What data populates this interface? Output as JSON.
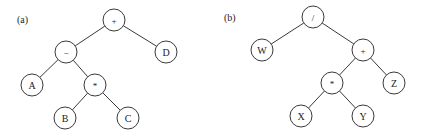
{
  "trees": [
    {
      "label": "(a)",
      "nodes": [
        {
          "id": "a_plus",
          "text": "+",
          "kind": "operator"
        },
        {
          "id": "a_minus",
          "text": "−",
          "kind": "operator"
        },
        {
          "id": "a_D",
          "text": "D",
          "kind": "operand"
        },
        {
          "id": "a_A",
          "text": "A",
          "kind": "operand"
        },
        {
          "id": "a_star",
          "text": "*",
          "kind": "operator"
        },
        {
          "id": "a_B",
          "text": "B",
          "kind": "operand"
        },
        {
          "id": "a_C",
          "text": "C",
          "kind": "operand"
        }
      ],
      "edges": [
        [
          "a_plus",
          "a_minus"
        ],
        [
          "a_plus",
          "a_D"
        ],
        [
          "a_minus",
          "a_A"
        ],
        [
          "a_minus",
          "a_star"
        ],
        [
          "a_star",
          "a_B"
        ],
        [
          "a_star",
          "a_C"
        ]
      ]
    },
    {
      "label": "(b)",
      "nodes": [
        {
          "id": "b_slash",
          "text": "/",
          "kind": "operator"
        },
        {
          "id": "b_W",
          "text": "W",
          "kind": "operand"
        },
        {
          "id": "b_plus",
          "text": "+",
          "kind": "operator"
        },
        {
          "id": "b_star",
          "text": "*",
          "kind": "operator"
        },
        {
          "id": "b_Z",
          "text": "Z",
          "kind": "operand"
        },
        {
          "id": "b_X",
          "text": "X",
          "kind": "operand"
        },
        {
          "id": "b_Y",
          "text": "Y",
          "kind": "operand"
        }
      ],
      "edges": [
        [
          "b_slash",
          "b_W"
        ],
        [
          "b_slash",
          "b_plus"
        ],
        [
          "b_plus",
          "b_star"
        ],
        [
          "b_plus",
          "b_Z"
        ],
        [
          "b_star",
          "b_X"
        ],
        [
          "b_star",
          "b_Y"
        ]
      ]
    }
  ]
}
